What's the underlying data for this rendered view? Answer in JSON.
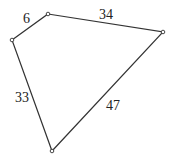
{
  "diagram": {
    "type": "quadrilateral",
    "vertices": [
      {
        "id": "top",
        "x": 48,
        "y": 14
      },
      {
        "id": "right",
        "x": 163,
        "y": 32
      },
      {
        "id": "bottom",
        "x": 52,
        "y": 151
      },
      {
        "id": "left",
        "x": 12,
        "y": 40
      }
    ],
    "sides": [
      {
        "from": "left",
        "to": "top",
        "label": "6",
        "lx": 23,
        "ly": 23
      },
      {
        "from": "top",
        "to": "right",
        "label": "34",
        "lx": 99,
        "ly": 19
      },
      {
        "from": "right",
        "to": "bottom",
        "label": "47",
        "lx": 106,
        "ly": 110
      },
      {
        "from": "bottom",
        "to": "left",
        "label": "33",
        "lx": 15,
        "ly": 102
      }
    ],
    "colors": {
      "stroke": "#333333",
      "text": "#222222",
      "background": "#ffffff"
    }
  }
}
